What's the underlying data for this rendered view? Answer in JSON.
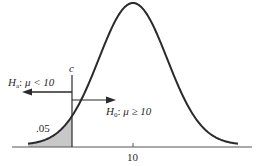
{
  "diagram": {
    "type": "one-tailed hypothesis test (left tail)",
    "curve": {
      "shape": "normal",
      "center_label": "10"
    },
    "axis": {
      "tick_label": "10"
    },
    "critical_value": {
      "label": "c"
    },
    "rejection_region": {
      "area_label": ".05",
      "fill_color": "#c8c8c8"
    },
    "alternative_hypothesis": {
      "symbol": "H",
      "subscript": "a",
      "statement": "μ < 10",
      "arrow_direction": "left"
    },
    "null_hypothesis": {
      "symbol": "H",
      "subscript": "0",
      "statement": "μ ≥ 10",
      "arrow_direction": "right"
    },
    "colors": {
      "line": "#2a2a2a",
      "shade": "#c8c8c8",
      "axis": "#555555"
    }
  }
}
